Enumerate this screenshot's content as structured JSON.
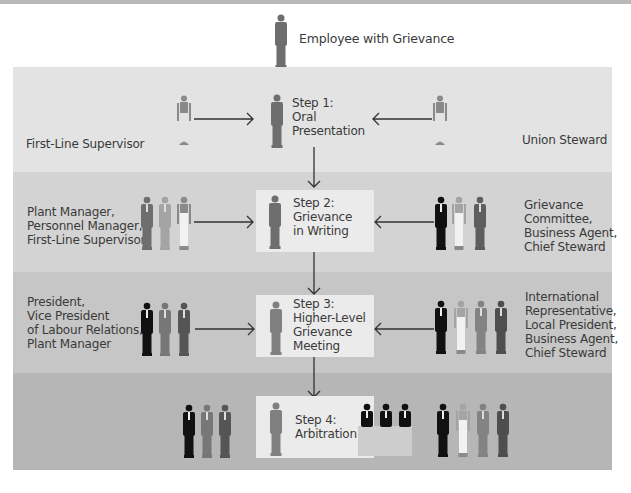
{
  "title": "Employee with Grievance",
  "colors": {
    "band1": "#e3e3e3",
    "band2": "#d3d3d3",
    "band3": "#c6c6c6",
    "band4": "#b6b6b6",
    "step_box": "#ebebeb",
    "figure_dark": "#111111",
    "figure_mid": "#777777",
    "figure_slate": "#555555",
    "figure_light": "#a9a9a9",
    "figure_white": "#f2f2f2"
  },
  "steps": [
    {
      "id": "step1",
      "label": "Step 1:\nOral\nPresentation",
      "management": "First-Line Supervisor",
      "union": "Union Steward"
    },
    {
      "id": "step2",
      "label": "Step 2:\nGrievance\nin Writing",
      "management": "Plant Manager,\nPersonnel Manager,\nFirst-Line Supervisor",
      "union": "Grievance\nCommittee,\nBusiness Agent,\nChief Steward"
    },
    {
      "id": "step3",
      "label": "Step 3:\nHigher-Level\nGrievance\nMeeting",
      "management": "President,\nVice President\nof Labour Relations,\nPlant Manager",
      "union": "International\nRepresentative,\nLocal President,\nBusiness Agent,\nChief Steward"
    },
    {
      "id": "step4",
      "label": "Step 4:\nArbitration",
      "management": "",
      "union": ""
    }
  ]
}
